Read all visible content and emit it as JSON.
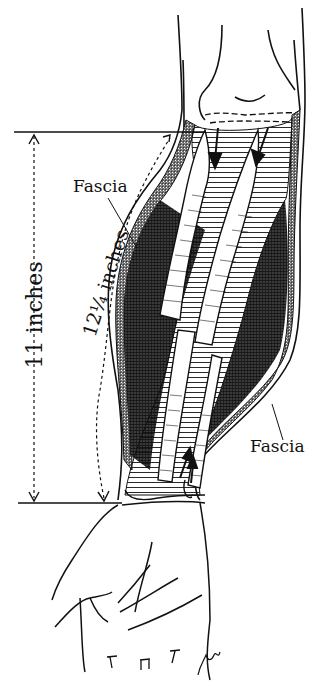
{
  "figure": {
    "labels": {
      "fascia_upper": "Fascia",
      "fascia_lower": "Fascia",
      "measure_straight": "11 inches",
      "measure_curved": "12¼ inches"
    },
    "colors": {
      "ink": "#111111",
      "paper": "#ffffff",
      "hatch_dark": "#2a2a2a"
    }
  }
}
